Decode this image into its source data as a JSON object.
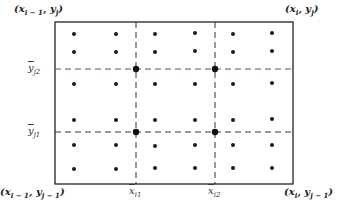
{
  "diagram": {
    "corners": {
      "top_left": {
        "x": "x",
        "x_sub": "i − 1",
        "y": "y",
        "y_sub": "j"
      },
      "top_right": {
        "x": "x",
        "x_sub": "i",
        "y": "y",
        "y_sub": "j"
      },
      "bottom_left": {
        "x": "x",
        "x_sub": "i − 1",
        "y": "y",
        "y_sub": "j − 1"
      },
      "bottom_right": {
        "x": "x",
        "x_sub": "i",
        "y": "y",
        "y_sub": "j − 1"
      }
    },
    "y_labels": {
      "y_j2": {
        "base": "y",
        "sub": "j2"
      },
      "y_j1": {
        "base": "y",
        "sub": "j1"
      }
    },
    "x_labels": {
      "x_i1": {
        "base": "x",
        "sub": "i1"
      },
      "x_i2": {
        "base": "x",
        "sub": "i2"
      }
    },
    "colors": {
      "frame": "#222222",
      "dashed_black": "#333333",
      "dashed_blue": "#4a4f8c",
      "dots": "#1a1a1a"
    },
    "grid": {
      "dot_columns": 6,
      "dot_rows": 6,
      "intersection_points": 4
    }
  }
}
